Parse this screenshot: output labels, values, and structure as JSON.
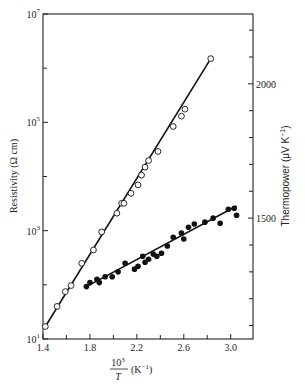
{
  "chart_data": {
    "type": "scatter",
    "title": "",
    "xlabel": "10^3/T (K^-1)",
    "ylabel_left": "Resistivity (Ω cm)",
    "ylabel_right": "Thermopower (μV K^-1)",
    "x_range": [
      1.4,
      3.19
    ],
    "x_ticks": [
      1.4,
      1.8,
      2.2,
      2.6,
      3.0
    ],
    "x_tick_labels": [
      "1.4",
      "1.8",
      "2.2",
      "2.6",
      "3.0"
    ],
    "x_minor_ticks": [
      1.6,
      2.0,
      2.4,
      2.8
    ],
    "y_left_scale": "log",
    "y_left_range": [
      10,
      10000000
    ],
    "y_left_ticks": [
      10,
      1000,
      100000,
      10000000
    ],
    "y_left_tick_labels": [
      {
        "base": "10",
        "exp": "1"
      },
      {
        "base": "10",
        "exp": "3"
      },
      {
        "base": "10",
        "exp": "5"
      },
      {
        "base": "10",
        "exp": "7"
      }
    ],
    "y_left_minor_ticks": [
      100,
      10000,
      1000000
    ],
    "y_right_scale": "linear",
    "y_right_range": [
      1050,
      2260
    ],
    "y_right_ticks": [
      1500,
      2000
    ],
    "y_right_tick_labels": [
      "1500",
      "2000"
    ],
    "y_right_minor_ticks": [
      1100,
      1200,
      1300,
      1400,
      1600,
      1700,
      1800,
      1900,
      2100,
      2200
    ],
    "grid": false,
    "legend": null,
    "series": [
      {
        "name": "Resistivity",
        "axis": "left",
        "marker": "open-circle",
        "fit_line": {
          "x": [
            1.42,
            2.83
          ],
          "y": [
            17,
            1500000
          ]
        },
        "points": [
          {
            "x": 1.42,
            "y": 17
          },
          {
            "x": 1.52,
            "y": 40
          },
          {
            "x": 1.59,
            "y": 75
          },
          {
            "x": 1.64,
            "y": 97
          },
          {
            "x": 1.73,
            "y": 250
          },
          {
            "x": 1.83,
            "y": 440
          },
          {
            "x": 1.9,
            "y": 950
          },
          {
            "x": 2.03,
            "y": 2100
          },
          {
            "x": 2.07,
            "y": 3200
          },
          {
            "x": 2.09,
            "y": 3200
          },
          {
            "x": 2.15,
            "y": 4900
          },
          {
            "x": 2.21,
            "y": 7000
          },
          {
            "x": 2.24,
            "y": 10600
          },
          {
            "x": 2.27,
            "y": 14900
          },
          {
            "x": 2.3,
            "y": 19700
          },
          {
            "x": 2.38,
            "y": 29000
          },
          {
            "x": 2.51,
            "y": 84000
          },
          {
            "x": 2.58,
            "y": 130000
          },
          {
            "x": 2.61,
            "y": 175000
          },
          {
            "x": 2.83,
            "y": 1500000
          }
        ]
      },
      {
        "name": "Thermopower",
        "axis": "right",
        "marker": "filled-circle",
        "fit_line": {
          "x": [
            1.77,
            3.05
          ],
          "y": [
            1245,
            1545
          ]
        },
        "points": [
          {
            "x": 1.77,
            "y": 1245
          },
          {
            "x": 1.8,
            "y": 1260
          },
          {
            "x": 1.86,
            "y": 1272
          },
          {
            "x": 1.88,
            "y": 1260
          },
          {
            "x": 1.93,
            "y": 1282
          },
          {
            "x": 1.99,
            "y": 1282
          },
          {
            "x": 2.04,
            "y": 1300
          },
          {
            "x": 2.1,
            "y": 1332
          },
          {
            "x": 2.18,
            "y": 1310
          },
          {
            "x": 2.21,
            "y": 1321
          },
          {
            "x": 2.25,
            "y": 1358
          },
          {
            "x": 2.27,
            "y": 1336
          },
          {
            "x": 2.3,
            "y": 1347
          },
          {
            "x": 2.34,
            "y": 1366
          },
          {
            "x": 2.37,
            "y": 1358
          },
          {
            "x": 2.41,
            "y": 1369
          },
          {
            "x": 2.46,
            "y": 1396
          },
          {
            "x": 2.51,
            "y": 1429
          },
          {
            "x": 2.58,
            "y": 1444
          },
          {
            "x": 2.6,
            "y": 1422
          },
          {
            "x": 2.64,
            "y": 1466
          },
          {
            "x": 2.69,
            "y": 1478
          },
          {
            "x": 2.78,
            "y": 1485
          },
          {
            "x": 2.85,
            "y": 1500
          },
          {
            "x": 2.91,
            "y": 1481
          },
          {
            "x": 2.98,
            "y": 1533
          },
          {
            "x": 3.03,
            "y": 1537
          },
          {
            "x": 3.05,
            "y": 1511
          }
        ]
      }
    ]
  },
  "labels": {
    "y_left_title": "Resistivity (Ω cm)",
    "y_right_title": "Thermopower (μV K",
    "y_right_title_sup": "−1",
    "y_right_title_end": ")",
    "x_title_numerator": "10",
    "x_title_numerator_sup": "3",
    "x_title_denominator": "T",
    "x_title_unit": "(K",
    "x_title_unit_sup": "−1",
    "x_title_unit_end": ")"
  }
}
